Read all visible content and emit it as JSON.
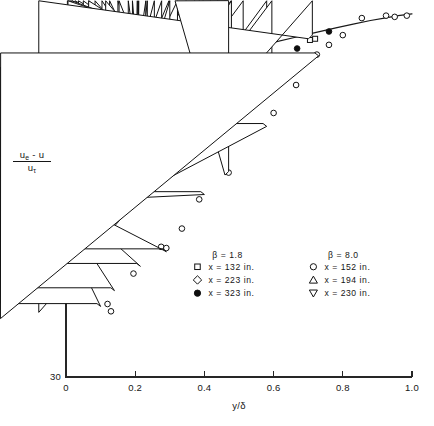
{
  "figure": {
    "name": "velocity-defect-profile-chart",
    "background_color": "#ffffff",
    "ink_color": "#161616"
  },
  "chart_data": {
    "type": "scatter",
    "title": "",
    "subtitle": "",
    "xlabel": "y/δ",
    "ylabel_numerator": "uₑ - u",
    "ylabel_denominator": "uτ",
    "xlim": [
      0.0,
      1.0
    ],
    "ylim": [
      30,
      0
    ],
    "y_inverted": true,
    "grid": false,
    "xticks": [
      0.0,
      0.2,
      0.4,
      0.6,
      0.8,
      1.0
    ],
    "xticklabels": [
      "0",
      "0.2",
      "0.4",
      "0.6",
      "0.8",
      "1.0"
    ],
    "yticks": [
      0,
      10,
      20,
      30
    ],
    "yticklabels": [
      "0",
      "10",
      "20",
      "30"
    ],
    "legend_position": "center-bottom-inside",
    "annotations": [
      {
        "text": "β = 1.8",
        "x": 0.44,
        "y": 20.5
      },
      {
        "text": "β = 8.0",
        "x": 0.76,
        "y": 20.5
      }
    ],
    "series": [
      {
        "name": "beta-1.8-x-132",
        "label": "x = 132 in.",
        "group": "β = 1.8",
        "marker": "square-open",
        "points": [
          [
            0.004,
            19.3
          ],
          [
            0.006,
            18.2
          ],
          [
            0.01,
            17.6
          ],
          [
            0.014,
            17.2
          ],
          [
            0.02,
            16.6
          ],
          [
            0.03,
            16.0
          ],
          [
            0.042,
            15.2
          ],
          [
            0.056,
            14.6
          ],
          [
            0.072,
            14.0
          ],
          [
            0.09,
            13.3
          ],
          [
            0.11,
            12.6
          ],
          [
            0.132,
            12.0
          ],
          [
            0.16,
            11.4
          ],
          [
            0.195,
            10.6
          ],
          [
            0.225,
            10.1
          ],
          [
            0.29,
            9.0
          ],
          [
            0.38,
            8.0
          ],
          [
            0.47,
            6.5
          ],
          [
            0.575,
            5.1
          ],
          [
            0.6,
            4.8
          ],
          [
            0.705,
            2.3
          ],
          [
            0.72,
            2.2
          ]
        ]
      },
      {
        "name": "beta-1.8-x-223",
        "label": "x = 223 in.",
        "group": "β = 1.8",
        "marker": "diamond-open",
        "points": [
          [
            0.004,
            19.0
          ],
          [
            0.008,
            18.0
          ],
          [
            0.012,
            17.5
          ],
          [
            0.018,
            16.9
          ],
          [
            0.026,
            16.3
          ],
          [
            0.036,
            15.7
          ],
          [
            0.05,
            15.0
          ],
          [
            0.066,
            14.3
          ],
          [
            0.084,
            13.6
          ],
          [
            0.104,
            12.9
          ],
          [
            0.126,
            12.3
          ],
          [
            0.15,
            11.7
          ],
          [
            0.18,
            11.0
          ],
          [
            0.21,
            10.3
          ],
          [
            0.235,
            9.9
          ],
          [
            0.3,
            8.8
          ],
          [
            0.385,
            7.7
          ],
          [
            0.478,
            6.3
          ],
          [
            0.58,
            4.9
          ],
          [
            0.595,
            4.6
          ],
          [
            0.712,
            2.2
          ]
        ]
      },
      {
        "name": "beta-1.8-x-323",
        "label": "x = 323 in.",
        "group": "β = 1.8",
        "marker": "circle-filled",
        "points": [
          [
            0.002,
            20.7
          ],
          [
            0.006,
            19.0
          ],
          [
            0.012,
            17.9
          ],
          [
            0.02,
            17.0
          ],
          [
            0.032,
            16.2
          ],
          [
            0.046,
            15.4
          ],
          [
            0.062,
            14.7
          ],
          [
            0.08,
            13.9
          ],
          [
            0.1,
            13.2
          ],
          [
            0.122,
            12.5
          ],
          [
            0.148,
            11.8
          ],
          [
            0.19,
            10.7
          ],
          [
            0.285,
            9.1
          ],
          [
            0.375,
            7.6
          ],
          [
            0.47,
            6.2
          ],
          [
            0.668,
            3.0
          ],
          [
            0.76,
            1.6
          ]
        ]
      },
      {
        "name": "beta-8.0-x-152",
        "label": "x = 152 in.",
        "group": "β = 8.0",
        "marker": "circle-open",
        "points": [
          [
            0.002,
            21.5
          ],
          [
            0.006,
            20.2
          ],
          [
            0.01,
            18.4
          ],
          [
            0.016,
            17.4
          ],
          [
            0.024,
            16.8
          ],
          [
            0.034,
            16.1
          ],
          [
            0.048,
            15.3
          ],
          [
            0.064,
            14.5
          ],
          [
            0.082,
            13.8
          ],
          [
            0.102,
            13.1
          ],
          [
            0.124,
            12.4
          ],
          [
            0.15,
            11.7
          ],
          [
            0.12,
            24.0
          ],
          [
            0.13,
            24.6
          ],
          [
            0.195,
            21.5
          ],
          [
            0.275,
            19.3
          ],
          [
            0.29,
            19.4
          ],
          [
            0.335,
            17.8
          ],
          [
            0.385,
            15.4
          ],
          [
            0.47,
            13.2
          ],
          [
            0.53,
            9.7
          ],
          [
            0.6,
            8.3
          ],
          [
            0.665,
            6.0
          ],
          [
            0.725,
            3.5
          ],
          [
            0.76,
            2.7
          ],
          [
            0.8,
            1.9
          ],
          [
            0.855,
            0.5
          ],
          [
            0.925,
            0.3
          ],
          [
            0.95,
            0.4
          ],
          [
            0.985,
            0.3
          ]
        ]
      },
      {
        "name": "beta-8.0-x-194",
        "label": "x = 194 in.",
        "group": "β = 8.0",
        "marker": "triangle-up-open",
        "points": [
          [
            0.47,
            13.4
          ]
        ]
      },
      {
        "name": "beta-8.0-x-230",
        "label": "x = 230 in.",
        "group": "β = 8.0",
        "marker": "triangle-down-open",
        "points": [
          [
            0.003,
            20.4
          ],
          [
            0.1,
            24.2
          ],
          [
            0.14,
            22.9
          ],
          [
            0.215,
            20.9
          ],
          [
            0.29,
            19.7
          ],
          [
            0.4,
            15.0
          ],
          [
            0.58,
            9.4
          ],
          [
            0.73,
            3.6
          ]
        ]
      }
    ],
    "curves": [
      {
        "name": "theoretical-defect-law",
        "style": "solid",
        "points": [
          [
            0.0005,
            21.0
          ],
          [
            0.001,
            19.2
          ],
          [
            0.002,
            17.4
          ],
          [
            0.003,
            16.3
          ],
          [
            0.004,
            15.6
          ],
          [
            0.006,
            14.6
          ],
          [
            0.008,
            13.9
          ],
          [
            0.01,
            13.4
          ],
          [
            0.014,
            12.6
          ],
          [
            0.018,
            12.0
          ],
          [
            0.024,
            11.4
          ],
          [
            0.03,
            10.9
          ],
          [
            0.04,
            10.3
          ],
          [
            0.05,
            9.8
          ],
          [
            0.065,
            9.2
          ],
          [
            0.08,
            8.7
          ],
          [
            0.1,
            8.2
          ],
          [
            0.125,
            7.6
          ],
          [
            0.15,
            7.1
          ],
          [
            0.18,
            6.6
          ],
          [
            0.22,
            6.0
          ],
          [
            0.26,
            5.5
          ],
          [
            0.31,
            4.9
          ],
          [
            0.36,
            4.4
          ],
          [
            0.42,
            3.9
          ],
          [
            0.48,
            3.4
          ],
          [
            0.54,
            3.0
          ],
          [
            0.6,
            2.5
          ],
          [
            0.66,
            2.1
          ],
          [
            0.72,
            1.7
          ],
          [
            0.78,
            1.3
          ],
          [
            0.83,
            1.0
          ],
          [
            0.88,
            0.7
          ],
          [
            0.92,
            0.5
          ],
          [
            0.96,
            0.3
          ],
          [
            1.0,
            0.15
          ]
        ]
      }
    ]
  },
  "legend": {
    "name": "series-legend",
    "columns": [
      {
        "header": "β = 1.8",
        "entries": [
          {
            "marker": "square-open",
            "label": "x = 132 in."
          },
          {
            "marker": "diamond-open",
            "label": "x = 223 in."
          },
          {
            "marker": "circle-filled",
            "label": "x = 323 in."
          }
        ]
      },
      {
        "header": "β = 8.0",
        "entries": [
          {
            "marker": "circle-open",
            "label": "x = 152 in."
          },
          {
            "marker": "triangle-up-open",
            "label": "x = 194 in."
          },
          {
            "marker": "triangle-down-open",
            "label": "x = 230 in."
          }
        ]
      }
    ]
  }
}
